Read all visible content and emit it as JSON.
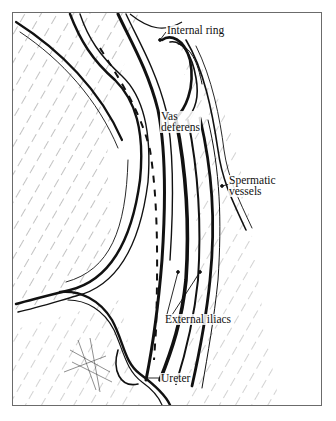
{
  "figure": {
    "type": "anatomical line drawing",
    "labels": {
      "internal_ring": "Internal ring",
      "vas_deferens_line1": "Vas",
      "vas_deferens_line2": "deferens",
      "spermatic_vessels_line1": "Spermatic",
      "spermatic_vessels_line2": "vessels",
      "external_iliacs": "External iliacs",
      "ureter": "Ureter"
    },
    "colors": {
      "ink": "#111111",
      "frame": "#6b6b6b",
      "background": "#ffffff"
    }
  }
}
